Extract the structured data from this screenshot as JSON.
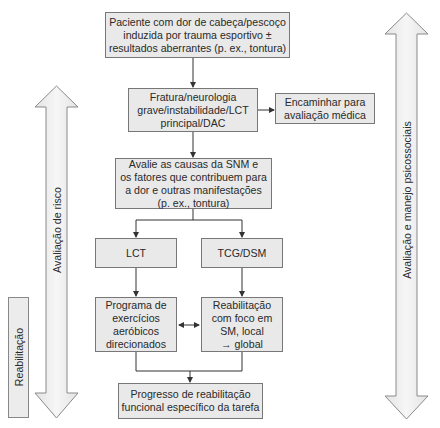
{
  "diagram": {
    "nodes": {
      "start": {
        "lines": [
          "Paciente com dor de cabeça/pescoço",
          "induzida por trauma esportivo ±",
          "resultados aberrantes (p. ex., tontura)"
        ]
      },
      "red_flags": {
        "lines": [
          "Fratura/neurologia",
          "grave/instabilidade/LCT",
          "principal/DAC"
        ]
      },
      "referral": {
        "lines": [
          "Encaminhar para",
          "avaliação médica"
        ]
      },
      "assess": {
        "lines": [
          "Avalie as causas da SNM e",
          "os fatores que contribuem para",
          "a dor e outras manifestações",
          "(p. ex., tontura)"
        ]
      },
      "lct": {
        "lines": [
          "LCT"
        ]
      },
      "tcg": {
        "lines": [
          "TCG/DSM"
        ]
      },
      "aerobic": {
        "lines": [
          "Programa de",
          "exercícios",
          "aeróbicos",
          "direcionados"
        ]
      },
      "rehab_sm": {
        "lines": [
          "Reabilitação",
          "com foco em",
          "SM, local",
          "→ global"
        ]
      },
      "progress": {
        "lines": [
          "Progresso de reabilitação",
          "funcional específico da tarefa"
        ]
      }
    },
    "side_labels": {
      "rehab": "Reabilitação",
      "risk": "Avaliação de risco",
      "psychosocial": "Avaliação e manejo psicossociais"
    },
    "colors": {
      "box_fill": "#e9e9e9",
      "box_border": "#777777",
      "line": "#333333",
      "arrow_fill": "#efefef",
      "arrow_stroke": "#8a8a8a"
    }
  }
}
